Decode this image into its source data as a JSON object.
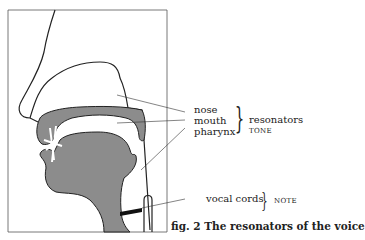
{
  "labels": {
    "nose": "nose",
    "mouth": "mouth",
    "pharynx": "pharynx",
    "resonators": "resonators",
    "tone": "TONE",
    "vocal_cords": "vocal cords",
    "note": "NOTE"
  },
  "caption": "fig. 2 The resonators of the voice",
  "colors": {
    "fill": "#8c8c8c",
    "line": "#222222"
  }
}
